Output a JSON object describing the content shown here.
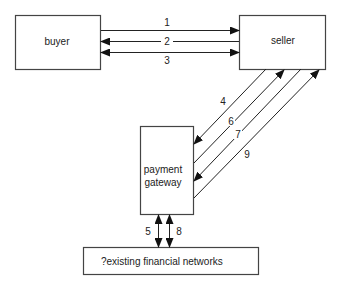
{
  "diagram": {
    "nodes": {
      "buyer": {
        "label": "buyer"
      },
      "seller": {
        "label": "seller"
      },
      "gateway": {
        "label_line1": "payment",
        "label_line2": "gateway"
      },
      "networks": {
        "label": "?existing financial networks"
      }
    },
    "edges": [
      {
        "id": "1",
        "label": "1",
        "from": "buyer",
        "to": "seller",
        "direction": "forward"
      },
      {
        "id": "2",
        "label": "2",
        "from": "seller",
        "to": "buyer",
        "direction": "forward"
      },
      {
        "id": "3",
        "label": "3",
        "from": "buyer",
        "to": "seller",
        "direction": "both"
      },
      {
        "id": "4",
        "label": "4",
        "from": "seller",
        "to": "gateway",
        "direction": "forward"
      },
      {
        "id": "5",
        "label": "5",
        "from": "gateway",
        "to": "networks",
        "direction": "both"
      },
      {
        "id": "6",
        "label": "6",
        "from": "gateway",
        "to": "seller",
        "direction": "forward"
      },
      {
        "id": "7",
        "label": "7",
        "from": "seller",
        "to": "gateway",
        "direction": "forward"
      },
      {
        "id": "8",
        "label": "8",
        "from": "gateway",
        "to": "networks",
        "direction": "both"
      },
      {
        "id": "9",
        "label": "9",
        "from": "gateway",
        "to": "seller",
        "direction": "forward"
      }
    ],
    "colors": {
      "line": "#222222",
      "box_stroke": "#444444",
      "background": "#ffffff"
    }
  }
}
